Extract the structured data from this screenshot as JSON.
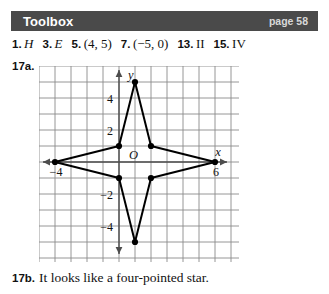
{
  "header": {
    "title": "Toolbox",
    "page_label": "page 58",
    "bar_color": "#4a4a4a",
    "title_color": "#ffffff",
    "page_color": "#d8d8d8"
  },
  "answers": [
    {
      "number": "1.",
      "value": "H",
      "style": "italic"
    },
    {
      "number": "3.",
      "value": "E",
      "style": "italic"
    },
    {
      "number": "5.",
      "value": "(4, 5)",
      "style": "upright"
    },
    {
      "number": "7.",
      "value": "(−5, 0)",
      "style": "upright"
    },
    {
      "number": "13.",
      "value": "II",
      "style": "upright"
    },
    {
      "number": "15.",
      "value": "IV",
      "style": "upright"
    }
  ],
  "problem_17a": {
    "label": "17a."
  },
  "problem_17b": {
    "label": "17b.",
    "text": "It looks like a four-pointed star."
  },
  "chart_data": {
    "type": "scatter",
    "title": "",
    "xlabel": "x",
    "ylabel": "y",
    "origin_label": "O",
    "grid": true,
    "xlim": [
      -5,
      7
    ],
    "ylim": [
      -6,
      6
    ],
    "x_tick_labels": [
      {
        "value": -4,
        "text": "−4"
      },
      {
        "value": 6,
        "text": "6"
      }
    ],
    "y_tick_labels": [
      {
        "value": 4,
        "text": "4"
      },
      {
        "value": 2,
        "text": "2"
      },
      {
        "value": -2,
        "text": "−2"
      },
      {
        "value": -4,
        "text": "−4"
      }
    ],
    "series": [
      {
        "name": "four-pointed star",
        "closed": true,
        "points": [
          [
            1,
            5
          ],
          [
            2,
            1
          ],
          [
            6,
            0
          ],
          [
            2,
            -1
          ],
          [
            1,
            -5
          ],
          [
            0,
            -1
          ],
          [
            -4,
            0
          ],
          [
            0,
            1
          ]
        ]
      }
    ],
    "line_color": "#000000",
    "point_color": "#000000",
    "grid_color": "#8a8a8a",
    "axis_color": "#4d4d4d"
  }
}
